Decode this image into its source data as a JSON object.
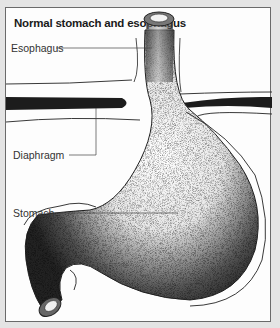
{
  "figure": {
    "title": "Normal stomach and esophagus",
    "labels": [
      {
        "id": "esophagus",
        "text": "Esophagus"
      },
      {
        "id": "diaphragm",
        "text": "Diaphragm"
      },
      {
        "id": "stomach",
        "text": "Stomach"
      }
    ]
  },
  "colors": {
    "background": "#e4e4e4",
    "panel": "#fdfdfd",
    "ink": "#1a1a1a",
    "label_text": "#333333"
  }
}
